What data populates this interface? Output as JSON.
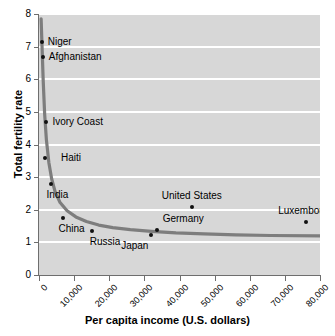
{
  "chart_data": {
    "type": "scatter",
    "title": "",
    "xlabel": "Per capita income (U.S. dollars)",
    "ylabel": "Total fertility rate",
    "xlim": [
      0,
      80000
    ],
    "ylim": [
      0,
      8
    ],
    "grid": true,
    "legend": "none",
    "xticks": [
      0,
      10000,
      20000,
      30000,
      40000,
      50000,
      60000,
      70000,
      80000
    ],
    "xtick_labels": [
      "0",
      "10,000",
      "20,000",
      "30,000",
      "40,000",
      "50,000",
      "60,000",
      "70,000",
      "80,000"
    ],
    "yticks": [
      0,
      1,
      2,
      3,
      4,
      5,
      6,
      7,
      8
    ],
    "ytick_labels": [
      "0",
      "1",
      "2",
      "3",
      "4",
      "5",
      "6",
      "7",
      "8"
    ],
    "points": [
      {
        "label": "Niger",
        "x": 800,
        "y": 7.15,
        "label_dx": 6,
        "label_dy": -5,
        "label_align": "left"
      },
      {
        "label": "Afghanistan",
        "x": 1100,
        "y": 6.68,
        "label_dx": 6,
        "label_dy": -5,
        "label_align": "left"
      },
      {
        "label": "Ivory Coast",
        "x": 2100,
        "y": 4.68,
        "label_dx": 6,
        "label_dy": -5,
        "label_align": "left"
      },
      {
        "label": "Haiti",
        "x": 1700,
        "y": 3.6,
        "label_dx": 16,
        "label_dy": -5,
        "label_align": "left"
      },
      {
        "label": "India",
        "x": 3300,
        "y": 2.78,
        "label_dx": -4,
        "label_dy": 6,
        "label_align": "left"
      },
      {
        "label": "China",
        "x": 6700,
        "y": 1.75,
        "label_dx": -4,
        "label_dy": 6,
        "label_align": "left"
      },
      {
        "label": "Russia",
        "x": 15000,
        "y": 1.35,
        "label_dx": -2,
        "label_dy": 6,
        "label_align": "left"
      },
      {
        "label": "Japan",
        "x": 32000,
        "y": 1.22,
        "label_dx": -3,
        "label_dy": 6,
        "label_align": "right"
      },
      {
        "label": "Germany",
        "x": 33500,
        "y": 1.37,
        "label_dx": 6,
        "label_dy": -16,
        "label_align": "left"
      },
      {
        "label": "United States",
        "x": 43500,
        "y": 2.08,
        "label_dx": 0,
        "label_dy": -16,
        "label_align": "center"
      },
      {
        "label": "Luxembourg",
        "x": 76000,
        "y": 1.63,
        "label_dx": 0,
        "label_dy": -16,
        "label_align": "center"
      }
    ],
    "trend": {
      "name": "fitted decay curve",
      "color": "#7d7d7d",
      "x": [
        600,
        900,
        1200,
        1600,
        2100,
        2800,
        3600,
        4600,
        6000,
        8000,
        10500,
        13500,
        17000,
        21000,
        26000,
        32000,
        39000,
        47000,
        56000,
        66000,
        80000
      ],
      "y": [
        7.85,
        6.9,
        5.95,
        4.95,
        4.15,
        3.45,
        2.95,
        2.55,
        2.22,
        1.97,
        1.78,
        1.64,
        1.53,
        1.45,
        1.39,
        1.34,
        1.29,
        1.26,
        1.23,
        1.21,
        1.2
      ]
    }
  },
  "colors": {
    "plot_background": "#d7d7d7",
    "gridline": "#ffffff",
    "axis": "#6e6e6e",
    "point": "#111111",
    "curve": "#7d7d7d",
    "text": "#000000"
  }
}
